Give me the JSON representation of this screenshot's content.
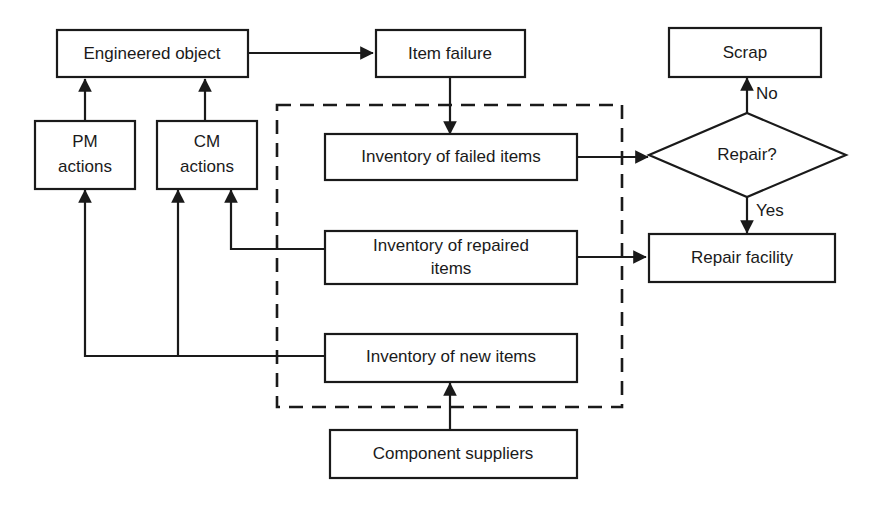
{
  "diagram": {
    "background_color": "#ffffff",
    "line_color": "#1a1a1a",
    "nodes": {
      "engineered_object": {
        "label": "Engineered object",
        "shape": "rect"
      },
      "item_failure": {
        "label": "Item failure",
        "shape": "rect"
      },
      "scrap": {
        "label": "Scrap",
        "shape": "rect"
      },
      "pm_actions_line1": {
        "label": "PM"
      },
      "pm_actions_line2": {
        "label": "actions"
      },
      "cm_actions_line1": {
        "label": "CM"
      },
      "cm_actions_line2": {
        "label": "actions"
      },
      "inventory_failed": {
        "label": "Inventory of failed items",
        "shape": "rect"
      },
      "inventory_repaired_line1": {
        "label": "Inventory of repaired"
      },
      "inventory_repaired_line2": {
        "label": "items"
      },
      "inventory_new": {
        "label": "Inventory of new items",
        "shape": "rect"
      },
      "component_suppliers": {
        "label": "Component suppliers",
        "shape": "rect"
      },
      "repair_decision": {
        "label": "Repair?",
        "shape": "diamond"
      },
      "repair_facility": {
        "label": "Repair facility",
        "shape": "rect"
      }
    },
    "edge_labels": {
      "no": "No",
      "yes": "Yes"
    }
  }
}
